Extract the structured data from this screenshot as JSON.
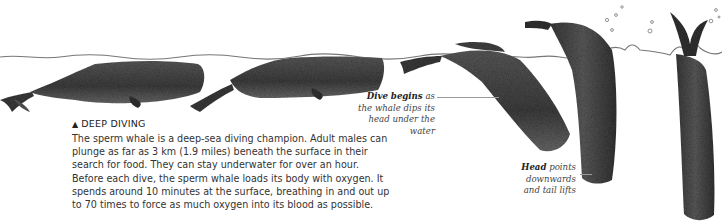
{
  "intro": {
    "title_icon": "triangle-up",
    "title_icon_glyph": "▲",
    "title": "DEEP DIVING",
    "body": "The sperm whale is a deep-sea diving champion. Adult males can plunge as far as 3 km (1.9 miles) beneath the surface in their search for food. They can stay underwater for over an hour. Before each dive, the sperm whale loads its body with oxygen. It spends around 10 minutes at the surface, breathing in and out up to 70 times to force as much oxygen into its blood as possible."
  },
  "annotations": {
    "dive": {
      "bold": "Dive begins",
      "rest": "as the whale dips its head under the water"
    },
    "head": {
      "bold": "Head",
      "rest": "points downwards and tail lifts"
    }
  },
  "illustration": {
    "stages": [
      "whale-at-surface-resting",
      "whale-at-surface-breathing",
      "whale-dive-begins",
      "whale-head-down-arched",
      "whale-vertical-tail-up"
    ],
    "water_color": "#6b6b6b",
    "whale_color": "#4a4a4a"
  }
}
